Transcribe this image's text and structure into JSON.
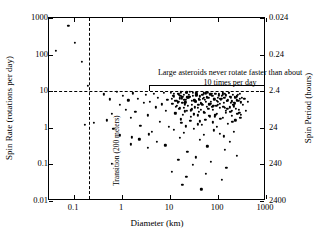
{
  "chart_data": {
    "type": "scatter",
    "title": "",
    "xlabel": "Diameter (km)",
    "ylabel": "Spin Rate (rotations per day)",
    "y2label": "Spin Period (hours)",
    "xscale": "log",
    "yscale": "log",
    "xlim": [
      0.03,
      1000
    ],
    "ylim": [
      0.01,
      1000
    ],
    "grid": false,
    "legend": null,
    "xticks": [
      {
        "value": 0.1,
        "label": "0.1"
      },
      {
        "value": 1,
        "label": "1"
      },
      {
        "value": 10,
        "label": "10"
      },
      {
        "value": 100,
        "label": "100"
      },
      {
        "value": 1000,
        "label": "1000"
      }
    ],
    "yticks": [
      {
        "value": 0.01,
        "label": "0.01"
      },
      {
        "value": 0.1,
        "label": "0.1"
      },
      {
        "value": 1,
        "label": "1"
      },
      {
        "value": 10,
        "label": "10"
      },
      {
        "value": 100,
        "label": "100"
      },
      {
        "value": 1000,
        "label": "1000"
      }
    ],
    "y2ticks": [
      {
        "value": 1000,
        "label": "0.024"
      },
      {
        "value": 100,
        "label": "0.24"
      },
      {
        "value": 10,
        "label": "2.4"
      },
      {
        "value": 1,
        "label": "24"
      },
      {
        "value": 0.1,
        "label": "240"
      },
      {
        "value": 0.01,
        "label": "2400"
      }
    ],
    "annotations": [
      {
        "id": "spin-barrier-note",
        "text": "Large asteroids never rotate faster than about 10 times per day",
        "kind": "bracket-label"
      },
      {
        "id": "transition-line-label",
        "text": "Transition (200 meters)",
        "kind": "vertical-dashed-line-label"
      }
    ],
    "reference_lines": [
      {
        "id": "spin-barrier",
        "orientation": "horizontal",
        "value": 10,
        "style": "dashed"
      },
      {
        "id": "size-transition",
        "orientation": "vertical",
        "value": 0.2,
        "style": "dashed"
      }
    ],
    "series": [
      {
        "name": "Asteroids",
        "marker": "filled-circle",
        "color": "#000000",
        "points": [
          [
            0.076,
            600
          ],
          [
            0.105,
            205
          ],
          [
            0.042,
            128
          ],
          [
            0.145,
            62
          ],
          [
            0.195,
            14
          ],
          [
            0.165,
            1.2
          ],
          [
            0.255,
            1.35
          ],
          [
            0.42,
            8.2
          ],
          [
            0.55,
            6.0
          ],
          [
            0.62,
            2.4
          ],
          [
            0.78,
            9.5
          ],
          [
            0.9,
            4.2
          ],
          [
            0.48,
            1.6
          ],
          [
            0.66,
            0.95
          ],
          [
            1.05,
            7.4
          ],
          [
            1.2,
            3.1
          ],
          [
            1.35,
            5.6
          ],
          [
            1.5,
            1.9
          ],
          [
            1.7,
            8.8
          ],
          [
            1.9,
            2.7
          ],
          [
            2.1,
            6.3
          ],
          [
            2.4,
            1.15
          ],
          [
            2.8,
            4.8
          ],
          [
            3.1,
            7.9
          ],
          [
            3.4,
            2.2
          ],
          [
            3.8,
            5.2
          ],
          [
            4.2,
            0.78
          ],
          [
            4.6,
            8.4
          ],
          [
            5.1,
            3.6
          ],
          [
            5.6,
            6.7
          ],
          [
            6.2,
            1.45
          ],
          [
            6.8,
            4.4
          ],
          [
            7.4,
            8.9
          ],
          [
            8.1,
            2.9
          ],
          [
            8.8,
            5.9
          ],
          [
            9.5,
            1.05
          ],
          [
            0.9,
            0.62
          ],
          [
            1.6,
            0.55
          ],
          [
            2.3,
            0.48
          ],
          [
            3.6,
            0.66
          ],
          [
            5.4,
            0.41
          ],
          [
            10.5,
            9.1
          ],
          [
            11.2,
            4.6
          ],
          [
            12.0,
            7.2
          ],
          [
            12.8,
            2.5
          ],
          [
            13.5,
            5.5
          ],
          [
            14.3,
            8.6
          ],
          [
            15.2,
            3.3
          ],
          [
            16.1,
            6.4
          ],
          [
            17.0,
            1.7
          ],
          [
            18.0,
            4.9
          ],
          [
            19.1,
            8.1
          ],
          [
            20.2,
            2.8
          ],
          [
            21.4,
            5.8
          ],
          [
            22.6,
            9.3
          ],
          [
            23.9,
            3.9
          ],
          [
            25.3,
            6.9
          ],
          [
            26.8,
            1.95
          ],
          [
            28.3,
            4.3
          ],
          [
            30.0,
            7.6
          ],
          [
            31.7,
            2.35
          ],
          [
            33.6,
            5.3
          ],
          [
            35.5,
            8.7
          ],
          [
            37.6,
            3.5
          ],
          [
            39.8,
            6.1
          ],
          [
            42.1,
            1.5
          ],
          [
            44.6,
            4.7
          ],
          [
            47.2,
            7.8
          ],
          [
            50.0,
            2.65
          ],
          [
            52.9,
            5.7
          ],
          [
            56.0,
            9.0
          ],
          [
            59.3,
            3.8
          ],
          [
            62.8,
            6.6
          ],
          [
            66.5,
            2.05
          ],
          [
            70.4,
            4.5
          ],
          [
            74.5,
            7.3
          ],
          [
            78.9,
            3.05
          ],
          [
            83.5,
            5.95
          ],
          [
            88.4,
            8.5
          ],
          [
            93.6,
            2.45
          ],
          [
            99.1,
            5.05
          ],
          [
            105,
            7.7
          ],
          [
            111,
            3.45
          ],
          [
            118,
            6.25
          ],
          [
            125,
            1.85
          ],
          [
            132,
            4.85
          ],
          [
            140,
            8.3
          ],
          [
            148,
            2.95
          ],
          [
            157,
            5.45
          ],
          [
            166,
            9.2
          ],
          [
            176,
            3.65
          ],
          [
            186,
            6.85
          ],
          [
            197,
            2.15
          ],
          [
            209,
            4.15
          ],
          [
            221,
            7.05
          ],
          [
            234,
            3.25
          ],
          [
            248,
            5.65
          ],
          [
            263,
            8.0
          ],
          [
            279,
            2.55
          ],
          [
            295,
            4.95
          ],
          [
            312,
            6.45
          ],
          [
            10.8,
            6.2
          ],
          [
            11.9,
            8.4
          ],
          [
            13.1,
            3.7
          ],
          [
            14.8,
            5.1
          ],
          [
            16.4,
            7.5
          ],
          [
            18.3,
            2.3
          ],
          [
            20.5,
            4.4
          ],
          [
            22.9,
            6.8
          ],
          [
            25.6,
            9.4
          ],
          [
            28.7,
            3.2
          ],
          [
            32.1,
            5.6
          ],
          [
            35.9,
            7.9
          ],
          [
            40.2,
            2.75
          ],
          [
            45.0,
            4.6
          ],
          [
            50.4,
            6.5
          ],
          [
            56.4,
            8.8
          ],
          [
            63.1,
            3.35
          ],
          [
            70.6,
            5.2
          ],
          [
            79.0,
            7.4
          ],
          [
            88.4,
            2.25
          ],
          [
            99.0,
            4.25
          ],
          [
            110.8,
            6.05
          ],
          [
            124.0,
            8.2
          ],
          [
            138.8,
            3.55
          ],
          [
            155.3,
            5.35
          ],
          [
            173.8,
            7.15
          ],
          [
            194.5,
            2.85
          ],
          [
            217.7,
            4.75
          ],
          [
            243.6,
            6.95
          ],
          [
            272.6,
            3.15
          ],
          [
            11.5,
            7.6
          ],
          [
            13.9,
            4.05
          ],
          [
            17.5,
            6.35
          ],
          [
            21.8,
            8.9
          ],
          [
            27.2,
            3.0
          ],
          [
            34.0,
            5.15
          ],
          [
            42.5,
            7.25
          ],
          [
            53.1,
            2.6
          ],
          [
            66.4,
            4.35
          ],
          [
            83.0,
            6.15
          ],
          [
            103.7,
            8.35
          ],
          [
            129.6,
            3.75
          ],
          [
            162.0,
            5.75
          ],
          [
            202.5,
            7.85
          ],
          [
            253.1,
            2.4
          ],
          [
            12.4,
            5.45
          ],
          [
            15.5,
            8.15
          ],
          [
            19.4,
            3.45
          ],
          [
            24.2,
            6.6
          ],
          [
            30.3,
            9.1
          ],
          [
            37.9,
            2.2
          ],
          [
            47.4,
            4.15
          ],
          [
            59.2,
            6.75
          ],
          [
            74.0,
            8.6
          ],
          [
            92.5,
            3.9
          ],
          [
            115.7,
            5.85
          ],
          [
            144.6,
            7.65
          ],
          [
            180.7,
            2.7
          ],
          [
            225.9,
            4.55
          ],
          [
            282.4,
            6.3
          ],
          [
            13.2,
            2.5
          ],
          [
            16.8,
            9.3
          ],
          [
            20.9,
            5.0
          ],
          [
            26.1,
            7.1
          ],
          [
            32.7,
            3.6
          ],
          [
            40.8,
            5.9
          ],
          [
            51.0,
            8.7
          ],
          [
            63.8,
            2.1
          ],
          [
            79.7,
            4.0
          ],
          [
            99.7,
            6.6
          ],
          [
            124.6,
            9.05
          ],
          [
            155.7,
            3.3
          ],
          [
            194.7,
            5.25
          ],
          [
            243.3,
            7.45
          ],
          [
            304.2,
            2.3
          ],
          [
            14.5,
            4.7
          ],
          [
            18.1,
            6.9
          ],
          [
            22.7,
            2.9
          ],
          [
            28.3,
            5.4
          ],
          [
            35.4,
            7.7
          ],
          [
            44.3,
            3.15
          ],
          [
            55.3,
            5.05
          ],
          [
            69.2,
            8.25
          ],
          [
            86.5,
            2.05
          ],
          [
            108.1,
            4.45
          ],
          [
            135.2,
            6.7
          ],
          [
            169.0,
            9.15
          ],
          [
            211.2,
            3.85
          ],
          [
            264.0,
            5.55
          ],
          [
            15.9,
            3.4
          ],
          [
            19.9,
            5.8
          ],
          [
            24.8,
            8.05
          ],
          [
            31.0,
            2.45
          ],
          [
            38.8,
            4.3
          ],
          [
            48.5,
            6.2
          ],
          [
            60.6,
            8.95
          ],
          [
            75.7,
            3.7
          ],
          [
            94.7,
            5.5
          ],
          [
            118.3,
            7.35
          ],
          [
            147.9,
            2.6
          ],
          [
            184.9,
            4.9
          ],
          [
            231.1,
            6.55
          ],
          [
            288.9,
            8.45
          ],
          [
            17.2,
            1.35
          ],
          [
            26.5,
            1.55
          ],
          [
            38.0,
            1.25
          ],
          [
            54.5,
            1.65
          ],
          [
            78.2,
            1.4
          ],
          [
            112.1,
            1.75
          ],
          [
            160.8,
            1.3
          ],
          [
            230.6,
            1.6
          ],
          [
            21.0,
            1.1
          ],
          [
            46.0,
            1.2
          ],
          [
            95.0,
            1.05
          ],
          [
            200.0,
            1.45
          ],
          [
            12.0,
            0.88
          ],
          [
            19.5,
            0.72
          ],
          [
            31.5,
            0.95
          ],
          [
            51.0,
            0.64
          ],
          [
            82.5,
            0.85
          ],
          [
            133.5,
            0.58
          ],
          [
            216.0,
            0.79
          ],
          [
            16.0,
            0.52
          ],
          [
            42.0,
            0.46
          ],
          [
            110.0,
            0.68
          ],
          [
            175.0,
            0.41
          ],
          [
            1.5,
            0.35
          ],
          [
            3.5,
            0.28
          ],
          [
            8.0,
            0.33
          ],
          [
            23.0,
            0.22
          ],
          [
            60.0,
            0.31
          ],
          [
            140.0,
            0.25
          ],
          [
            0.62,
            0.105
          ],
          [
            15.0,
            0.135
          ],
          [
            30.0,
            0.098
          ],
          [
            70.0,
            0.115
          ],
          [
            150.0,
            0.082
          ],
          [
            11.0,
            0.062
          ],
          [
            22.0,
            0.045
          ],
          [
            55.0,
            0.055
          ],
          [
            120.0,
            0.038
          ],
          [
            18.0,
            0.028
          ],
          [
            45.0,
            0.021
          ],
          [
            35.0,
            0.155
          ],
          [
            250.0,
            0.175
          ],
          [
            330,
            4.2
          ],
          [
            355,
            6.1
          ],
          [
            380,
            2.9
          ],
          [
            420,
            5.2
          ],
          [
            290,
            1.9
          ]
        ]
      }
    ]
  }
}
